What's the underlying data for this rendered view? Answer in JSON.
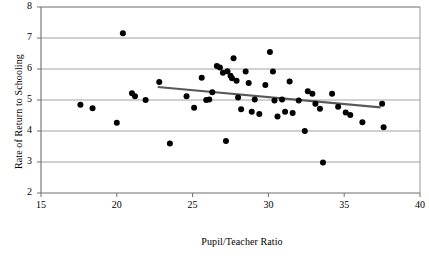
{
  "chart_data": {
    "type": "scatter",
    "title": "",
    "xlabel": "Pupil/Teacher Ratio",
    "ylabel": "Rate of Return to Schooling",
    "xlim": [
      15,
      40
    ],
    "ylim": [
      2,
      8
    ],
    "xticks": [
      15,
      20,
      25,
      30,
      35,
      40
    ],
    "yticks": [
      2,
      3,
      4,
      5,
      6,
      7,
      8
    ],
    "grid": "horizontal",
    "legend": "none",
    "marker": {
      "shape": "circle",
      "color": "#000000",
      "size": 5.2
    },
    "points": [
      {
        "x": 17.6,
        "y": 4.85
      },
      {
        "x": 18.4,
        "y": 4.73
      },
      {
        "x": 20.0,
        "y": 4.27
      },
      {
        "x": 20.4,
        "y": 7.15
      },
      {
        "x": 21.0,
        "y": 5.22
      },
      {
        "x": 21.2,
        "y": 5.12
      },
      {
        "x": 21.9,
        "y": 5.0
      },
      {
        "x": 22.8,
        "y": 5.58
      },
      {
        "x": 23.5,
        "y": 3.6
      },
      {
        "x": 24.6,
        "y": 5.12
      },
      {
        "x": 25.1,
        "y": 4.75
      },
      {
        "x": 25.6,
        "y": 5.72
      },
      {
        "x": 25.9,
        "y": 5.0
      },
      {
        "x": 26.1,
        "y": 5.02
      },
      {
        "x": 26.3,
        "y": 5.25
      },
      {
        "x": 26.6,
        "y": 6.1
      },
      {
        "x": 26.8,
        "y": 6.05
      },
      {
        "x": 27.0,
        "y": 5.88
      },
      {
        "x": 27.2,
        "y": 3.68
      },
      {
        "x": 27.3,
        "y": 5.93
      },
      {
        "x": 27.5,
        "y": 5.78
      },
      {
        "x": 27.6,
        "y": 5.7
      },
      {
        "x": 27.7,
        "y": 6.35
      },
      {
        "x": 27.9,
        "y": 5.62
      },
      {
        "x": 28.0,
        "y": 5.08
      },
      {
        "x": 28.2,
        "y": 4.7
      },
      {
        "x": 28.5,
        "y": 5.92
      },
      {
        "x": 28.7,
        "y": 5.55
      },
      {
        "x": 28.9,
        "y": 4.62
      },
      {
        "x": 29.1,
        "y": 5.02
      },
      {
        "x": 29.4,
        "y": 4.55
      },
      {
        "x": 29.8,
        "y": 5.48
      },
      {
        "x": 30.1,
        "y": 6.55
      },
      {
        "x": 30.3,
        "y": 5.92
      },
      {
        "x": 30.4,
        "y": 4.98
      },
      {
        "x": 30.6,
        "y": 4.47
      },
      {
        "x": 30.9,
        "y": 5.02
      },
      {
        "x": 31.1,
        "y": 4.62
      },
      {
        "x": 31.4,
        "y": 5.6
      },
      {
        "x": 31.6,
        "y": 4.58
      },
      {
        "x": 32.0,
        "y": 4.98
      },
      {
        "x": 32.4,
        "y": 4.0
      },
      {
        "x": 32.6,
        "y": 5.28
      },
      {
        "x": 32.9,
        "y": 5.2
      },
      {
        "x": 33.1,
        "y": 4.88
      },
      {
        "x": 33.4,
        "y": 4.72
      },
      {
        "x": 33.6,
        "y": 2.98
      },
      {
        "x": 34.2,
        "y": 5.2
      },
      {
        "x": 34.6,
        "y": 4.78
      },
      {
        "x": 35.1,
        "y": 4.6
      },
      {
        "x": 35.4,
        "y": 4.52
      },
      {
        "x": 36.2,
        "y": 4.28
      },
      {
        "x": 37.5,
        "y": 4.88
      },
      {
        "x": 37.6,
        "y": 4.12
      }
    ],
    "trendline": {
      "color": "#595959",
      "width": 2.2,
      "x_start": 22.7,
      "y_start": 5.42,
      "x_end": 37.4,
      "y_end": 4.76
    }
  }
}
